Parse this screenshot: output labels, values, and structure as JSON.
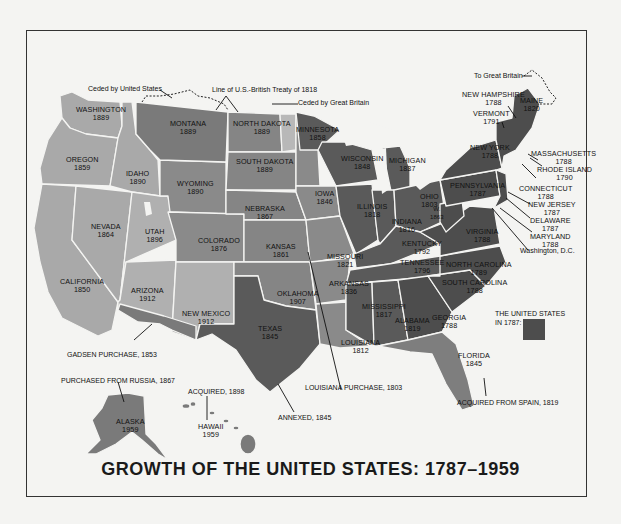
{
  "title": "GROWTH OF THE UNITED STATES: 1787–1959",
  "colors": {
    "original_1787": "#4d4d4d",
    "dark_region": "#5c5c5c",
    "mid_region": "#7e7e7e",
    "light_region": "#a6a6a6",
    "lighter_region": "#b8b8b8",
    "background": "#f4f4f2",
    "border": "#333333"
  },
  "states": [
    {
      "name": "WASHINGTON",
      "year": "1889"
    },
    {
      "name": "OREGON",
      "year": "1859"
    },
    {
      "name": "CALIFORNIA",
      "year": "1850"
    },
    {
      "name": "IDAHO",
      "year": "1890"
    },
    {
      "name": "NEVADA",
      "year": "1864"
    },
    {
      "name": "MONTANA",
      "year": "1889"
    },
    {
      "name": "WYOMING",
      "year": "1890"
    },
    {
      "name": "UTAH",
      "year": "1896"
    },
    {
      "name": "ARIZONA",
      "year": "1912"
    },
    {
      "name": "COLORADO",
      "year": "1876"
    },
    {
      "name": "NEW MEXICO",
      "year": "1912"
    },
    {
      "name": "NORTH DAKOTA",
      "year": "1889"
    },
    {
      "name": "SOUTH DAKOTA",
      "year": "1889"
    },
    {
      "name": "NEBRASKA",
      "year": "1867"
    },
    {
      "name": "KANSAS",
      "year": "1861"
    },
    {
      "name": "OKLAHOMA",
      "year": "1907"
    },
    {
      "name": "TEXAS",
      "year": "1845"
    },
    {
      "name": "MINNESOTA",
      "year": "1858"
    },
    {
      "name": "IOWA",
      "year": "1846"
    },
    {
      "name": "MISSOURI",
      "year": "1821"
    },
    {
      "name": "ARKANSAS",
      "year": "1836"
    },
    {
      "name": "LOUISIANA",
      "year": "1812"
    },
    {
      "name": "WISCONSIN",
      "year": "1848"
    },
    {
      "name": "ILLINOIS",
      "year": "1818"
    },
    {
      "name": "MICHIGAN",
      "year": "1837"
    },
    {
      "name": "INDIANA",
      "year": "1816"
    },
    {
      "name": "OHIO",
      "year": "1803"
    },
    {
      "name": "KENTUCKY",
      "year": "1792"
    },
    {
      "name": "TENNESSEE",
      "year": "1796"
    },
    {
      "name": "MISSISSIPPI",
      "year": "1817"
    },
    {
      "name": "ALABAMA",
      "year": "1819"
    },
    {
      "name": "GEORGIA",
      "year": "1788"
    },
    {
      "name": "FLORIDA",
      "year": "1845"
    },
    {
      "name": "SOUTH CAROLINA",
      "year": "1788"
    },
    {
      "name": "NORTH CAROLINA",
      "year": "1789"
    },
    {
      "name": "VIRGINIA",
      "year": "1788"
    },
    {
      "name": "WEST VIRGINIA",
      "year": "1863"
    },
    {
      "name": "PENNSYLVANIA",
      "year": "1787"
    },
    {
      "name": "NEW YORK",
      "year": "1788"
    },
    {
      "name": "VERMONT",
      "year": "1791"
    },
    {
      "name": "NEW HAMPSHIRE",
      "year": "1788"
    },
    {
      "name": "MAINE",
      "year": "1820"
    },
    {
      "name": "MASSACHUSETTS",
      "year": "1788"
    },
    {
      "name": "RHODE ISLAND",
      "year": "1790"
    },
    {
      "name": "CONNECTICUT",
      "year": "1788"
    },
    {
      "name": "NEW JERSEY",
      "year": "1787"
    },
    {
      "name": "DELAWARE",
      "year": "1787"
    },
    {
      "name": "MARYLAND",
      "year": "1788"
    },
    {
      "name": "ALASKA",
      "year": "1959"
    },
    {
      "name": "HAWAII",
      "year": "1959"
    }
  ],
  "annotations": {
    "ceded_by_us": "Ceded by United States",
    "treaty_1818": "Line of U.S.-British Treaty of 1818",
    "ceded_by_gb": "Ceded by Great Britain",
    "to_gb": "To Great Britain",
    "dc": "Washington, D.C.",
    "gadsen": "GADSEN PURCHASE, 1853",
    "russia": "PURCHASED FROM RUSSIA, 1867",
    "acquired_1898": "ACQUIRED, 1898",
    "annexed": "ANNEXED, 1845",
    "louisiana_purchase": "LOUISIANA PURCHASE, 1803",
    "spain": "ACQUIRED FROM SPAIN, 1819"
  },
  "legend": {
    "label_line1": "THE UNITED STATES",
    "label_line2": "IN 1787:"
  }
}
